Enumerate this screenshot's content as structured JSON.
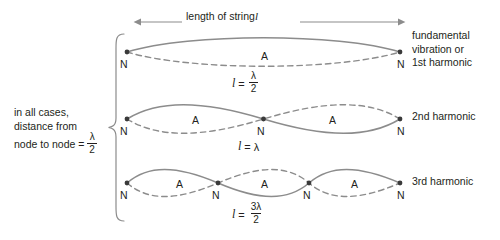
{
  "figure": {
    "title_measure": "length of string",
    "title_measure_symbol": "l",
    "left_note_line1": "in all cases,",
    "left_note_line2": "distance from",
    "left_note_line3": "node to node =",
    "left_note_fraction_numerator": "λ",
    "left_note_fraction_denominator": "2",
    "node_letter": "N",
    "antinode_letter": "A",
    "colors": {
      "wave_stroke": "#8c8c8c",
      "node_dot": "#3a3a3a",
      "text": "#231f20",
      "arrow": "#8c8c8c",
      "brace": "#8c8c8c",
      "background": "#ffffff"
    },
    "rows": [
      {
        "name": "first-harmonic",
        "right_label_lines": [
          "fundamental",
          "vibration or",
          "1st harmonic"
        ],
        "equation": {
          "lhs": "l",
          "operator": "=",
          "numerator": "λ",
          "denominator": "2",
          "plain": "l = λ/2"
        },
        "node_count": 2,
        "antinode_count": 1,
        "node_labels": [
          "N",
          "N"
        ],
        "antinode_labels": [
          "A"
        ]
      },
      {
        "name": "second-harmonic",
        "right_label_lines": [
          "2nd harmonic"
        ],
        "equation": {
          "lhs": "l",
          "operator": "=",
          "numerator": "λ",
          "denominator": "",
          "plain": "l = λ"
        },
        "node_count": 3,
        "antinode_count": 2,
        "node_labels": [
          "N",
          "N",
          "N"
        ],
        "antinode_labels": [
          "A",
          "A"
        ]
      },
      {
        "name": "third-harmonic",
        "right_label_lines": [
          "3rd harmonic"
        ],
        "equation": {
          "lhs": "l",
          "operator": "=",
          "numerator": "3λ",
          "denominator": "2",
          "plain": "l = 3λ/2"
        },
        "node_count": 4,
        "antinode_count": 3,
        "node_labels": [
          "N",
          "N",
          "N",
          "N"
        ],
        "antinode_labels": [
          "A",
          "A",
          "A"
        ]
      }
    ]
  }
}
